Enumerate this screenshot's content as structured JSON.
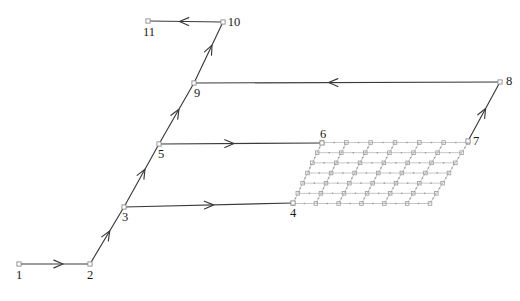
{
  "figure": {
    "title": "",
    "type": "node-path-diagram-with-mesh",
    "width": 520,
    "height": 301,
    "background_color": "#ffffff",
    "line_color": "#3a3a3a",
    "mesh_color": "#9a9a9a",
    "label_color": "#1a1a1a",
    "node_marker": "small-open-square"
  },
  "nodes": [
    {
      "id": "1",
      "label": "1",
      "x": 19,
      "y": 264,
      "label_dx": 0,
      "label_dy": 15,
      "label_anchor": "middle"
    },
    {
      "id": "2",
      "label": "2",
      "x": 90,
      "y": 264,
      "label_dx": 0,
      "label_dy": 15,
      "label_anchor": "middle"
    },
    {
      "id": "3",
      "label": "3",
      "x": 124,
      "y": 207,
      "label_dx": 1,
      "label_dy": 14,
      "label_anchor": "middle"
    },
    {
      "id": "4",
      "label": "4",
      "x": 293,
      "y": 203,
      "label_dx": 0,
      "label_dy": 14,
      "label_anchor": "middle"
    },
    {
      "id": "5",
      "label": "5",
      "x": 159,
      "y": 144,
      "label_dx": 2,
      "label_dy": 14,
      "label_anchor": "middle"
    },
    {
      "id": "6",
      "label": "6",
      "x": 322,
      "y": 143,
      "label_dx": 1,
      "label_dy": -5,
      "label_anchor": "middle"
    },
    {
      "id": "7",
      "label": "7",
      "x": 468,
      "y": 141,
      "label_dx": 8,
      "label_dy": 4,
      "label_anchor": "middle"
    },
    {
      "id": "8",
      "label": "8",
      "x": 500,
      "y": 82,
      "label_dx": 9,
      "label_dy": 3,
      "label_anchor": "middle"
    },
    {
      "id": "9",
      "label": "9",
      "x": 194,
      "y": 83,
      "label_dx": 3,
      "label_dy": 14,
      "label_anchor": "middle"
    },
    {
      "id": "10",
      "label": "10",
      "x": 223,
      "y": 22,
      "label_dx": 11,
      "label_dy": 4,
      "label_anchor": "middle"
    },
    {
      "id": "11",
      "label": "11",
      "x": 148,
      "y": 21,
      "label_dx": 1,
      "label_dy": 15,
      "label_anchor": "middle"
    }
  ],
  "edges": [
    {
      "id": "e1",
      "from": "1",
      "to": "2",
      "direction": "forward",
      "arrow_t": 0.62
    },
    {
      "id": "e2",
      "from": "2",
      "to": "3",
      "direction": "forward",
      "arrow_t": 0.58
    },
    {
      "id": "e3",
      "from": "3",
      "to": "4",
      "direction": "forward",
      "arrow_t": 0.53
    },
    {
      "id": "e4",
      "from": "3",
      "to": "5",
      "direction": "forward",
      "arrow_t": 0.6
    },
    {
      "id": "e5",
      "from": "5",
      "to": "6",
      "direction": "forward",
      "arrow_t": 0.46
    },
    {
      "id": "e6",
      "from": "5",
      "to": "9",
      "direction": "forward",
      "arrow_t": 0.57
    },
    {
      "id": "e7",
      "from": "8",
      "to": "9",
      "direction": "forward",
      "arrow_t": 0.56
    },
    {
      "id": "e8",
      "from": "7",
      "to": "8",
      "direction": "forward",
      "arrow_t": 0.55
    },
    {
      "id": "e9",
      "from": "9",
      "to": "10",
      "direction": "forward",
      "arrow_t": 0.62
    },
    {
      "id": "e10",
      "from": "10",
      "to": "11",
      "direction": "forward",
      "arrow_t": 0.58
    }
  ],
  "mesh": {
    "name": "quadrilateral-mesh-patch",
    "corners": {
      "bottom_left": {
        "x": 293,
        "y": 203.5
      },
      "bottom_right": {
        "x": 430,
        "y": 203.5
      },
      "top_right": {
        "x": 468,
        "y": 142.5
      },
      "top_left": {
        "x": 322,
        "y": 142.5
      }
    },
    "divisions_u": 6,
    "divisions_v": 6,
    "show_vertex_markers": true,
    "show_edge_midpoints": true
  },
  "chart_data": {
    "type": "diagram",
    "title": "",
    "nodes": [
      "1",
      "2",
      "3",
      "4",
      "5",
      "6",
      "7",
      "8",
      "9",
      "10",
      "11"
    ],
    "directed_edges": [
      [
        "1",
        "2"
      ],
      [
        "2",
        "3"
      ],
      [
        "3",
        "4"
      ],
      [
        "3",
        "5"
      ],
      [
        "5",
        "6"
      ],
      [
        "5",
        "9"
      ],
      [
        "8",
        "9"
      ],
      [
        "7",
        "8"
      ],
      [
        "9",
        "10"
      ],
      [
        "10",
        "11"
      ]
    ],
    "mesh_cells_u": 6,
    "mesh_cells_v": 6
  }
}
